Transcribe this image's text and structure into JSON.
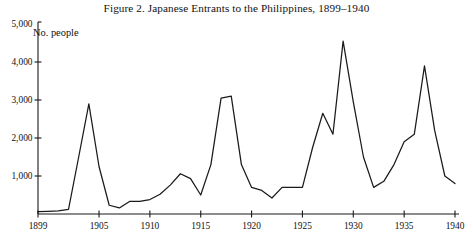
{
  "figure": {
    "title": "Figure 2. Japanese Entrants to the Philippines, 1899–1940",
    "series_label": "No. people"
  },
  "chart_data": {
    "type": "line",
    "title": "Figure 2. Japanese Entrants to the Philippines, 1899–1940",
    "subtitle": "",
    "xlabel": "",
    "ylabel": "No. people",
    "xlim": [
      1899,
      1940
    ],
    "ylim": [
      0,
      5000
    ],
    "grid": false,
    "legend": "none",
    "annotations": [
      "No. people"
    ],
    "ytick_labels": [
      "1,000",
      "2,000",
      "3,000",
      "4,000",
      "5,000"
    ],
    "ytick_values": [
      1000,
      2000,
      3000,
      4000,
      5000
    ],
    "xtick_labels": [
      "1899",
      "1905",
      "1910",
      "1915",
      "1920",
      "1925",
      "1930",
      "1935",
      "1940"
    ],
    "xtick_values": [
      1899,
      1905,
      1910,
      1915,
      1920,
      1925,
      1930,
      1935,
      1940
    ],
    "x": [
      1899,
      1900,
      1901,
      1902,
      1903,
      1904,
      1905,
      1906,
      1907,
      1908,
      1909,
      1910,
      1911,
      1912,
      1913,
      1914,
      1915,
      1916,
      1917,
      1918,
      1919,
      1920,
      1921,
      1922,
      1923,
      1924,
      1925,
      1926,
      1927,
      1928,
      1929,
      1930,
      1931,
      1932,
      1933,
      1934,
      1935,
      1936,
      1937,
      1938,
      1939,
      1940
    ],
    "values": [
      60,
      70,
      80,
      120,
      1500,
      2900,
      1250,
      230,
      160,
      330,
      330,
      380,
      520,
      760,
      1060,
      930,
      500,
      1300,
      3050,
      3100,
      1300,
      700,
      620,
      420,
      700,
      700,
      700,
      1750,
      2650,
      2100,
      4550,
      2950,
      1500,
      700,
      860,
      1300,
      1900,
      2100,
      3900,
      2200,
      1000,
      800
    ],
    "series": [
      {
        "name": "No. people",
        "color": "#1a1a1a",
        "values": [
          60,
          70,
          80,
          120,
          1500,
          2900,
          1250,
          230,
          160,
          330,
          330,
          380,
          520,
          760,
          1060,
          930,
          500,
          1300,
          3050,
          3100,
          1300,
          700,
          620,
          420,
          700,
          700,
          700,
          1750,
          2650,
          2100,
          4550,
          2950,
          1500,
          700,
          860,
          1300,
          1900,
          2100,
          3900,
          2200,
          1000,
          800
        ]
      }
    ]
  },
  "style": {
    "line_color": "#1a1a1a",
    "axis_color": "#1a1a1a",
    "background": "#ffffff"
  }
}
